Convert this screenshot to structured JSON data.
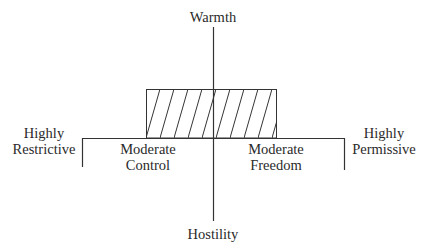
{
  "diagram": {
    "vertical_axis": {
      "top_label": "Warmth",
      "bottom_label": "Hostility"
    },
    "horizontal_axis": {
      "left_extreme": [
        "Highly",
        "Restrictive"
      ],
      "left_moderate": [
        "Moderate",
        "Control"
      ],
      "right_moderate": [
        "Moderate",
        "Freedom"
      ],
      "right_extreme": [
        "Highly",
        "Permissive"
      ]
    },
    "hatched_region": {
      "description": "Optimal zone: warm, between moderate control and moderate freedom",
      "pattern": "diagonal-hatch"
    },
    "colors": {
      "line": "#333333",
      "text": "#2a2a2a",
      "background": "#ffffff"
    }
  }
}
